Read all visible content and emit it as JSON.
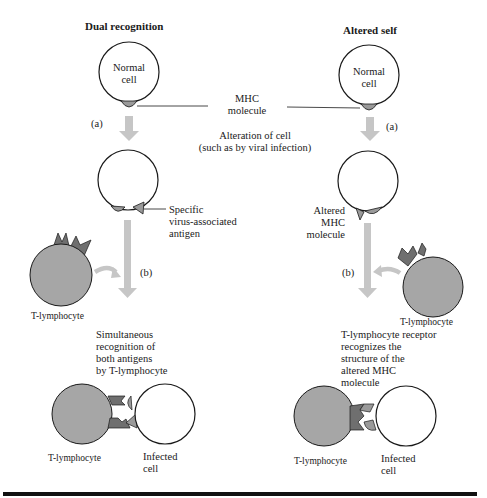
{
  "colors": {
    "tcell_fill": "#a6a6a6",
    "receptor_fill": "#6f6f6f",
    "mhc_fill": "#9a9a9a",
    "arrow_fill": "#c6c6c6",
    "outline": "#1a1a1a",
    "rule": "#111111"
  },
  "left_panel": {
    "title": "Dual recognition",
    "normal_cell_label_1": "Normal",
    "normal_cell_label_2": "cell",
    "step_a": "(a)",
    "antigen_label_1": "Specific",
    "antigen_label_2": "virus-associated",
    "antigen_label_3": "antigen",
    "step_b": "(b)",
    "tlymphocyte_label": "T-lymphocyte",
    "result_1": "Simultaneous",
    "result_2": "recognition of",
    "result_3": "both antigens",
    "result_4": "by T-lymphocyte",
    "bottom_tcell_label": "T-lymphocyte",
    "infected_label_1": "Infected",
    "infected_label_2": "cell"
  },
  "center": {
    "mhc_label_1": "MHC",
    "mhc_label_2": "molecule",
    "alteration_1": "Alteration of cell",
    "alteration_2": "(such as by viral infection)"
  },
  "right_panel": {
    "title": "Altered self",
    "normal_cell_label_1": "Normal",
    "normal_cell_label_2": "cell",
    "step_a": "(a)",
    "altered_mhc_1": "Altered",
    "altered_mhc_2": "MHC",
    "altered_mhc_3": "molecule",
    "step_b": "(b)",
    "tlymphocyte_label": "T-lymphocyte",
    "result_1": "T-lymphocyte receptor",
    "result_2": "recognizes the",
    "result_3": "structure of the",
    "result_4": "altered MHC",
    "result_5": "molecule",
    "bottom_tcell_label": "T-lymphocyte",
    "infected_label_1": "Infected",
    "infected_label_2": "cell"
  }
}
